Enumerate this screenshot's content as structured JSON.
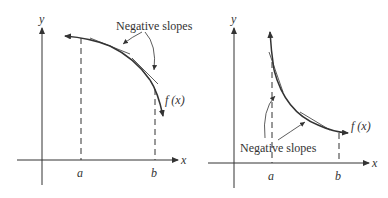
{
  "figures": [
    {
      "id": "left",
      "axis_x_label": "x",
      "axis_y_label": "y",
      "tick_a": "a",
      "tick_b": "b",
      "function_label": "f (x)",
      "annotation": "Negative slopes",
      "description": "Decreasing, concave-down curve on [a,b] with tangent lines showing negative slopes"
    },
    {
      "id": "right",
      "axis_x_label": "x",
      "axis_y_label": "y",
      "tick_a": "a",
      "tick_b": "b",
      "function_label": "f (x)",
      "annotation": "Negative slopes",
      "description": "Decreasing, concave-up curve on [a,b] with tangent lines showing negative slopes"
    }
  ],
  "colors": {
    "stroke": "#333333",
    "background": "#ffffff"
  }
}
